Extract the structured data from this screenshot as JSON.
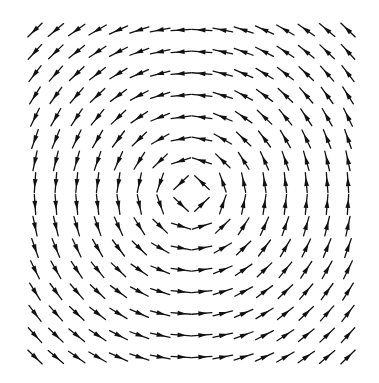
{
  "diagram": {
    "type": "vector-field",
    "field": "F(x,y) = (-y, x)",
    "grid": {
      "cols": 16,
      "rows": 16
    },
    "layout": {
      "x_start": 35,
      "x_end": 348,
      "y_start": 30,
      "y_end": 357,
      "arrow_length": 20,
      "center_x": 191.5,
      "center_y": 193.5
    },
    "colors": {
      "arrow": "#111111",
      "background": "#ffffff"
    }
  }
}
